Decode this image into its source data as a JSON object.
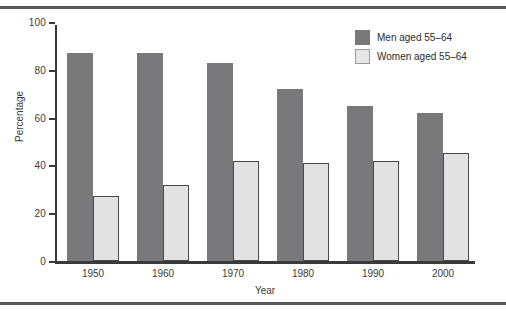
{
  "figure": {
    "has_top_rule": true,
    "has_bottom_rule": true,
    "rule_color": "#58585a"
  },
  "legend": {
    "position": "top-right",
    "entries": [
      {
        "label": "Men aged 55–64",
        "color": "#79797b",
        "swatch": "men-swatch"
      },
      {
        "label": "Women aged 55–64",
        "color": "#e6e6e6",
        "swatch": "women-swatch"
      }
    ]
  },
  "chart_data": {
    "type": "bar",
    "title": "",
    "xlabel": "Year",
    "ylabel": "Percentage",
    "categories": [
      "1950",
      "1960",
      "1970",
      "1980",
      "1990",
      "2000"
    ],
    "series": [
      {
        "name": "Men aged 55–64",
        "color": "#79797b",
        "values": [
          87,
          87,
          83,
          72,
          65,
          62
        ]
      },
      {
        "name": "Women aged 55–64",
        "color": "#e2e2e2",
        "values": [
          27,
          32,
          42,
          41,
          42,
          45
        ]
      }
    ],
    "ylim": [
      0,
      100
    ],
    "yticks": [
      0,
      20,
      40,
      60,
      80,
      100
    ],
    "ytick_labels": [
      "0",
      "20",
      "40",
      "60",
      "80",
      "100"
    ],
    "grid": false,
    "legend_position": "top-right"
  }
}
